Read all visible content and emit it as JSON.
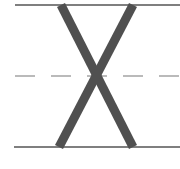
{
  "worksheet": {
    "type": "handwriting-practice",
    "letter": "X",
    "colors": {
      "guide_line": "#555555",
      "midline": "#777777",
      "letter_stroke": "#505050",
      "background": "#ffffff"
    },
    "lines": {
      "top": {
        "y": 5,
        "x1": 15,
        "x2": 180,
        "style": "solid"
      },
      "mid": {
        "y": 76,
        "x1": 15,
        "x2": 180,
        "style": "dashed"
      },
      "base": {
        "y": 147,
        "x1": 14,
        "x2": 180,
        "style": "solid"
      }
    }
  }
}
